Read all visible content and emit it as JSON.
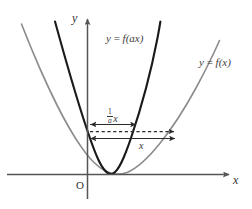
{
  "figure": {
    "type": "math-graph",
    "axes": {
      "x_axis_label": "x",
      "y_axis_label": "y",
      "origin_label": "O"
    },
    "curves": [
      {
        "name": "transformed-curve",
        "label": "y = f(ax)",
        "label_parts": {
          "lhs": "y",
          "equals": "=",
          "rhs": "f(ax)"
        },
        "color": "#1a1a1a",
        "width": 2.1,
        "style": "solid",
        "note": "narrow parabola"
      },
      {
        "name": "original-curve",
        "label": "y = f(x)",
        "label_parts": {
          "lhs": "y",
          "equals": "=",
          "rhs": "f(x)"
        },
        "color": "#8c8c8c",
        "width": 1.6,
        "style": "solid",
        "note": "wide parabola"
      }
    ],
    "measurements": [
      {
        "name": "scaled-width",
        "label_fraction_numerator": "1",
        "label_fraction_denominator": "a",
        "label_variable": "x",
        "label_plain": "(1/a)x",
        "arrow": "double-headed",
        "style": "solid"
      },
      {
        "name": "original-width",
        "label_plain": "x",
        "label_variable": "x",
        "arrow": "double-headed",
        "style": "solid"
      },
      {
        "name": "reference-level",
        "style": "dashed",
        "label_plain": ""
      }
    ],
    "colors": {
      "axis": "#555555",
      "dark_curve": "#1a1a1a",
      "gray_curve": "#8c8c8c",
      "measure": "#2b2b2b",
      "background": "#ffffff"
    }
  }
}
